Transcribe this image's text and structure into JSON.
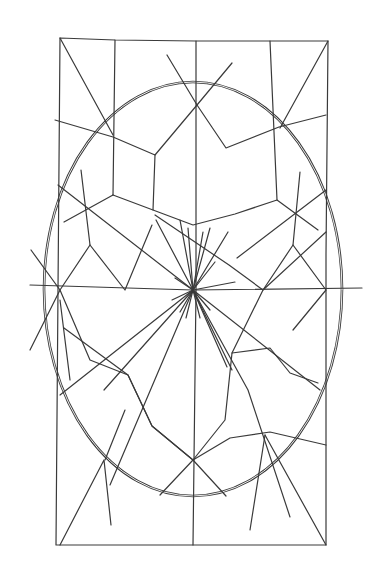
{
  "image": {
    "description": "Hand-drawn geometric line drawing: rectangle with inscribed ellipse, radial star pattern and web-like polygonal network",
    "background": "#ffffff",
    "stroke": "#3a3a3a"
  },
  "rectangle": {
    "points": [
      [
        60,
        38
      ],
      [
        115,
        40
      ],
      [
        196,
        41
      ],
      [
        270,
        41
      ],
      [
        328,
        41
      ],
      [
        326,
        254
      ],
      [
        326,
        545
      ],
      [
        193,
        545
      ],
      [
        56,
        545
      ],
      [
        58,
        290
      ],
      [
        60,
        38
      ]
    ]
  },
  "center_verticals": [
    [
      196,
      41
    ],
    [
      196,
      290
    ],
    [
      193,
      545
    ]
  ],
  "ellipse": {
    "cx": 193,
    "cy": 289,
    "rx": 149,
    "ry": 207
  },
  "center": [
    193,
    290
  ],
  "polylines": [
    [
      [
        60,
        38
      ],
      [
        113,
        135
      ]
    ],
    [
      [
        328,
        41
      ],
      [
        280,
        128
      ]
    ],
    [
      [
        115,
        40
      ],
      [
        113,
        195
      ]
    ],
    [
      [
        270,
        41
      ],
      [
        277,
        200
      ]
    ],
    [
      [
        55,
        120
      ],
      [
        113,
        137
      ],
      [
        155,
        155
      ],
      [
        197,
        105
      ],
      [
        232,
        63
      ]
    ],
    [
      [
        167,
        55
      ],
      [
        197,
        105
      ],
      [
        226,
        148
      ],
      [
        279,
        127
      ],
      [
        326,
        115
      ]
    ],
    [
      [
        155,
        155
      ],
      [
        153,
        210
      ],
      [
        193,
        225
      ],
      [
        235,
        214
      ],
      [
        277,
        200
      ],
      [
        318,
        230
      ]
    ],
    [
      [
        113,
        195
      ],
      [
        153,
        210
      ]
    ],
    [
      [
        113,
        195
      ],
      [
        64,
        222
      ]
    ],
    [
      [
        81,
        170
      ],
      [
        90,
        245
      ],
      [
        60,
        290
      ],
      [
        90,
        360
      ],
      [
        128,
        375
      ],
      [
        152,
        426
      ],
      [
        193,
        460
      ],
      [
        225,
        420
      ],
      [
        232,
        353
      ],
      [
        270,
        348
      ],
      [
        290,
        373
      ],
      [
        318,
        383
      ]
    ],
    [
      [
        90,
        245
      ],
      [
        125,
        290
      ],
      [
        152,
        225
      ]
    ],
    [
      [
        300,
        172
      ],
      [
        293,
        245
      ],
      [
        263,
        290
      ],
      [
        232,
        353
      ]
    ],
    [
      [
        293,
        245
      ],
      [
        326,
        290
      ],
      [
        293,
        330
      ]
    ],
    [
      [
        58,
        185
      ],
      [
        193,
        290
      ],
      [
        320,
        390
      ]
    ],
    [
      [
        31,
        250
      ],
      [
        60,
        290
      ],
      [
        30,
        350
      ]
    ],
    [
      [
        326,
        232
      ],
      [
        263,
        290
      ],
      [
        229,
        265
      ],
      [
        155,
        215
      ]
    ],
    [
      [
        30,
        285
      ],
      [
        193,
        290
      ],
      [
        362,
        288
      ]
    ],
    [
      [
        326,
        190
      ],
      [
        237,
        258
      ]
    ],
    [
      [
        64,
        328
      ],
      [
        128,
        375
      ],
      [
        152,
        426
      ],
      [
        193,
        460
      ],
      [
        230,
        438
      ],
      [
        270,
        432
      ],
      [
        326,
        445
      ]
    ],
    [
      [
        60,
        395
      ],
      [
        193,
        290
      ]
    ],
    [
      [
        104,
        390
      ],
      [
        193,
        290
      ],
      [
        110,
        485
      ]
    ],
    [
      [
        193,
        290
      ],
      [
        232,
        370
      ]
    ],
    [
      [
        156,
        220
      ],
      [
        193,
        290
      ],
      [
        227,
        367
      ]
    ],
    [
      [
        193,
        290
      ],
      [
        228,
        232
      ]
    ],
    [
      [
        193,
        290
      ],
      [
        248,
        390
      ],
      [
        290,
        517
      ]
    ],
    [
      [
        105,
        460
      ],
      [
        125,
        410
      ]
    ],
    [
      [
        60,
        545
      ],
      [
        104,
        460
      ],
      [
        111,
        525
      ]
    ],
    [
      [
        160,
        495
      ],
      [
        193,
        460
      ],
      [
        226,
        496
      ]
    ],
    [
      [
        265,
        435
      ],
      [
        250,
        530
      ]
    ],
    [
      [
        265,
        435
      ],
      [
        326,
        545
      ]
    ],
    [
      [
        60,
        300
      ],
      [
        70,
        380
      ]
    ]
  ],
  "radial_burst": {
    "center": [
      193,
      290
    ],
    "spokes": [
      [
        180,
        220
      ],
      [
        188,
        228
      ],
      [
        203,
        232
      ],
      [
        210,
        228
      ],
      [
        215,
        262
      ],
      [
        235,
        282
      ],
      [
        180,
        312
      ],
      [
        186,
        318
      ],
      [
        200,
        318
      ],
      [
        210,
        310
      ],
      [
        172,
        300
      ],
      [
        175,
        278
      ]
    ]
  }
}
